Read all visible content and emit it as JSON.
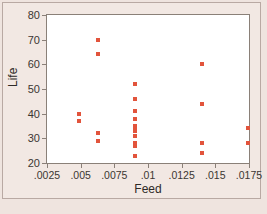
{
  "chart_data": {
    "type": "scatter",
    "title": "",
    "xlabel": "Feed",
    "ylabel": "Life",
    "xlim": [
      0.0025,
      0.0175
    ],
    "ylim": [
      20,
      80
    ],
    "grid": false,
    "legend": null,
    "marker_color": "#e2543c",
    "marker_shape": "square",
    "xticks": [
      0.0025,
      0.005,
      0.0075,
      0.01,
      0.0125,
      0.015,
      0.0175
    ],
    "xticklabels": [
      ".0025",
      ".005",
      ".0075",
      ".01",
      ".0125",
      ".015",
      ".0175"
    ],
    "yticks": [
      20,
      30,
      40,
      50,
      60,
      70,
      80
    ],
    "yticklabels": [
      "20",
      "30",
      "40",
      "50",
      "60",
      "70",
      "80"
    ],
    "points": [
      {
        "x": 0.00485,
        "y": 40
      },
      {
        "x": 0.00485,
        "y": 37
      },
      {
        "x": 0.00625,
        "y": 70
      },
      {
        "x": 0.00625,
        "y": 64
      },
      {
        "x": 0.00625,
        "y": 32
      },
      {
        "x": 0.00625,
        "y": 29
      },
      {
        "x": 0.009,
        "y": 52
      },
      {
        "x": 0.009,
        "y": 46
      },
      {
        "x": 0.009,
        "y": 41
      },
      {
        "x": 0.009,
        "y": 38
      },
      {
        "x": 0.009,
        "y": 35
      },
      {
        "x": 0.009,
        "y": 34
      },
      {
        "x": 0.009,
        "y": 33
      },
      {
        "x": 0.009,
        "y": 31
      },
      {
        "x": 0.009,
        "y": 28
      },
      {
        "x": 0.009,
        "y": 27
      },
      {
        "x": 0.009,
        "y": 23
      },
      {
        "x": 0.014,
        "y": 60
      },
      {
        "x": 0.014,
        "y": 44
      },
      {
        "x": 0.014,
        "y": 28
      },
      {
        "x": 0.014,
        "y": 24
      },
      {
        "x": 0.01745,
        "y": 34
      },
      {
        "x": 0.01745,
        "y": 28
      }
    ]
  },
  "caption": ""
}
